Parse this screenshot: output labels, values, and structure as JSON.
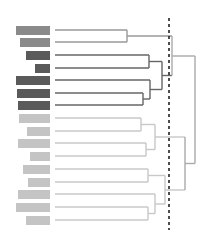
{
  "diagram": {
    "type": "dendrogram",
    "title": "",
    "cut_line": {
      "x": 169,
      "y1": 18,
      "y2": 230,
      "style": "dashed",
      "color": "#222222"
    },
    "colors": {
      "medium": "#8a8a8a",
      "dark": "#5a5a5a",
      "light": "#c4c4c4",
      "link_dark": "#666666",
      "link_medium": "#999999",
      "link_light": "#c8c8c8",
      "root_link": "#aaaaaa"
    },
    "leaves": [
      {
        "y": 30,
        "bar_x": 16,
        "group": "medium",
        "line_end": 127
      },
      {
        "y": 42,
        "bar_x": 20,
        "group": "medium",
        "line_end": 127
      },
      {
        "y": 55,
        "bar_x": 26,
        "group": "dark",
        "line_end": 149
      },
      {
        "y": 68,
        "bar_x": 35,
        "group": "dark",
        "line_end": 149
      },
      {
        "y": 80,
        "bar_x": 16,
        "group": "dark",
        "line_end": 150
      },
      {
        "y": 93,
        "bar_x": 17,
        "group": "dark",
        "line_end": 143
      },
      {
        "y": 105,
        "bar_x": 18,
        "group": "dark",
        "line_end": 143
      },
      {
        "y": 118,
        "bar_x": 19,
        "group": "light",
        "line_end": 141
      },
      {
        "y": 131,
        "bar_x": 27,
        "group": "light",
        "line_end": 141
      },
      {
        "y": 143,
        "bar_x": 18,
        "group": "light",
        "line_end": 146
      },
      {
        "y": 156,
        "bar_x": 30,
        "group": "light",
        "line_end": 146
      },
      {
        "y": 169,
        "bar_x": 23,
        "group": "light",
        "line_end": 148
      },
      {
        "y": 182,
        "bar_x": 28,
        "group": "light",
        "line_end": 148
      },
      {
        "y": 194,
        "bar_x": 18,
        "group": "light",
        "line_end": 155
      },
      {
        "y": 207,
        "bar_x": 16,
        "group": "light",
        "line_end": 148
      },
      {
        "y": 220,
        "bar_x": 26,
        "group": "light",
        "line_end": 148
      }
    ],
    "bar_right": 50,
    "line_start": 55
  }
}
